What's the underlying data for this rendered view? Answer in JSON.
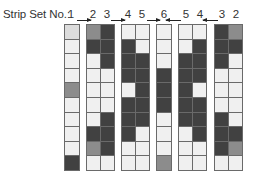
{
  "header": {
    "label": "Strip Set No.:",
    "numbers": [
      "1",
      "2",
      "3",
      "4",
      "5",
      "6",
      "5",
      "4",
      "3",
      "2"
    ]
  },
  "arrows": [
    {
      "from": "1",
      "to": "2",
      "direction": "right"
    },
    {
      "from": "3",
      "to": "4",
      "direction": "right"
    },
    {
      "from": "5",
      "to": "6",
      "direction": "right"
    },
    {
      "from": "5",
      "to": "6",
      "direction": "left"
    },
    {
      "from": "3",
      "to": "4",
      "direction": "left"
    }
  ],
  "colors": {
    "white": "#f0f0f0",
    "light": "#dcdcdc",
    "mid": "#8c8c8c",
    "dark": "#414141",
    "border": "#6a6a6a"
  },
  "groups": [
    {
      "strips": [
        {
          "no": "1",
          "cells": [
            "l",
            "w",
            "w",
            "w",
            "m",
            "w",
            "w",
            "w",
            "w",
            "d"
          ]
        }
      ]
    },
    {
      "strips": [
        {
          "no": "2",
          "cells": [
            "m",
            "d",
            "w",
            "w",
            "w",
            "w",
            "w",
            "d",
            "m",
            "w"
          ]
        },
        {
          "no": "3",
          "cells": [
            "d",
            "d",
            "d",
            "w",
            "w",
            "w",
            "d",
            "d",
            "d",
            "w"
          ]
        }
      ]
    },
    {
      "strips": [
        {
          "no": "4",
          "cells": [
            "w",
            "d",
            "d",
            "d",
            "w",
            "d",
            "d",
            "d",
            "w",
            "w"
          ]
        },
        {
          "no": "5",
          "cells": [
            "w",
            "w",
            "d",
            "d",
            "d",
            "d",
            "d",
            "w",
            "w",
            "w"
          ]
        }
      ]
    },
    {
      "strips": [
        {
          "no": "6",
          "cells": [
            "w",
            "w",
            "w",
            "d",
            "d",
            "d",
            "w",
            "w",
            "w",
            "m"
          ]
        }
      ]
    },
    {
      "strips": [
        {
          "no": "5",
          "cells": [
            "w",
            "w",
            "d",
            "d",
            "d",
            "d",
            "d",
            "w",
            "w",
            "w"
          ]
        },
        {
          "no": "4",
          "cells": [
            "w",
            "d",
            "d",
            "d",
            "w",
            "d",
            "d",
            "d",
            "w",
            "w"
          ]
        }
      ]
    },
    {
      "strips": [
        {
          "no": "3",
          "cells": [
            "d",
            "d",
            "d",
            "w",
            "w",
            "w",
            "d",
            "d",
            "d",
            "w"
          ]
        },
        {
          "no": "2",
          "cells": [
            "m",
            "d",
            "w",
            "w",
            "w",
            "w",
            "w",
            "d",
            "m",
            "w"
          ]
        }
      ]
    }
  ]
}
